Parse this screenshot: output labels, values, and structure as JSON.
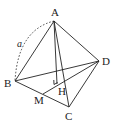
{
  "figure": {
    "type": "tetrahedron",
    "vertices": {
      "A": {
        "label": "A",
        "x": 54,
        "y": 21,
        "lx": 51,
        "ly": 16
      },
      "B": {
        "label": "B",
        "x": 15,
        "y": 81,
        "lx": 4,
        "ly": 87
      },
      "C": {
        "label": "C",
        "x": 69,
        "y": 107,
        "lx": 65,
        "ly": 120
      },
      "D": {
        "label": "D",
        "x": 99,
        "y": 61,
        "lx": 102,
        "ly": 65
      },
      "M": {
        "label": "M",
        "x": 43,
        "y": 94,
        "lx": 34,
        "ly": 104
      },
      "H": {
        "label": "H",
        "x": 57,
        "y": 84,
        "lx": 58,
        "ly": 95
      }
    },
    "edge_length_label": "a",
    "colors": {
      "line": "#222222",
      "background": "#ffffff"
    }
  }
}
